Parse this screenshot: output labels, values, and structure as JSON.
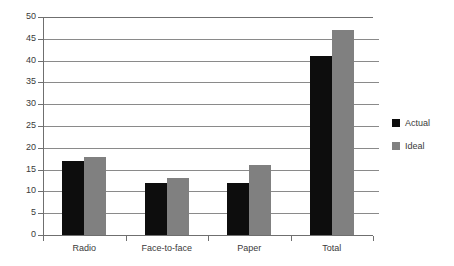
{
  "chart_data": {
    "type": "bar",
    "title": "",
    "subtitle": "",
    "xlabel": "",
    "ylabel": "",
    "categories": [
      "Radio",
      "Face-to-face",
      "Paper",
      "Total"
    ],
    "series": [
      {
        "name": "Actual",
        "color": "#0d0d0d",
        "values": [
          17,
          12,
          12,
          41
        ]
      },
      {
        "name": "Ideal",
        "color": "#808080",
        "values": [
          18,
          13,
          16,
          47
        ]
      }
    ],
    "ylim": [
      0,
      50
    ],
    "ytick_step": 5,
    "yticks": [
      0,
      5,
      10,
      15,
      20,
      25,
      30,
      35,
      40,
      45,
      50
    ],
    "ytick_labels": [
      "0",
      "5",
      "10",
      "15",
      "20",
      "25",
      "30",
      "35",
      "40",
      "45",
      "50"
    ],
    "grid": true,
    "grid_axis": "y",
    "legend": true,
    "legend_position": "right",
    "legend_entries": [
      "Actual",
      "Ideal"
    ],
    "background_color": "#ffffff",
    "axis_color": "#6f6f6f",
    "gridline_color": "#8a8a8a",
    "text_color": "#3a3a3a"
  }
}
